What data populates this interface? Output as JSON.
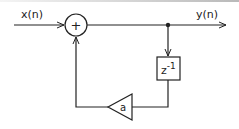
{
  "diagram": {
    "type": "block-diagram",
    "input_label": "x(n)",
    "output_label": "y(n)",
    "adder_symbol": "+",
    "delay_block": {
      "base": "z",
      "exponent": "-1"
    },
    "gain_block": {
      "label": "a"
    },
    "colors": {
      "line": "#222222",
      "background": "#ffffff"
    },
    "connections": [
      {
        "from": "x(n)",
        "to": "adder"
      },
      {
        "from": "adder",
        "to": "y(n)"
      },
      {
        "from": "y(n) junction",
        "to": "delay z^-1"
      },
      {
        "from": "delay z^-1",
        "to": "gain a"
      },
      {
        "from": "gain a",
        "to": "adder"
      }
    ]
  }
}
